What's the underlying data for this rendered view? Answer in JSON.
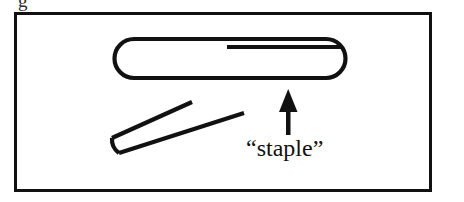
{
  "figure": {
    "background_color": "#ffffff",
    "ink_color": "#111111",
    "frame": {
      "name": "figure-border",
      "x": 14,
      "y": 12,
      "width": 418,
      "height": 180,
      "stroke_width": 3,
      "stroke_color": "#111111",
      "fill_color": "#ffffff"
    },
    "cut_off_glyph_above": "g",
    "annotation": {
      "label": "“staple”",
      "label_plain": "staple",
      "quote_style": "curly-double",
      "font_size_px": 24,
      "color": "#111111",
      "x": 246,
      "y": 136
    },
    "arrow": {
      "name": "up-arrow",
      "direction": "up",
      "tail_x": 288,
      "tail_y": 134,
      "head_x": 288,
      "head_y": 90,
      "shaft_width": 4,
      "head_width": 18,
      "head_height": 22,
      "color": "#111111",
      "points_to": "upper-paperclip"
    },
    "shapes": [
      {
        "name": "upper-paperclip",
        "description": "complete horizontal paperclip, outer loop with inner wire and open gap at right of inner stem",
        "orientation": "horizontal",
        "stroke_width": 4,
        "left": 114,
        "right": 350,
        "top": 37,
        "bottom": 76
      },
      {
        "name": "lower-paperclip",
        "description": "partially drawn tilted paperclip, hairpin bend at lower left with two diverging straight arms rising to the right",
        "orientation": "tilted",
        "stroke_width": 4,
        "left": 99,
        "right": 245,
        "top": 101,
        "bottom": 155
      }
    ]
  }
}
